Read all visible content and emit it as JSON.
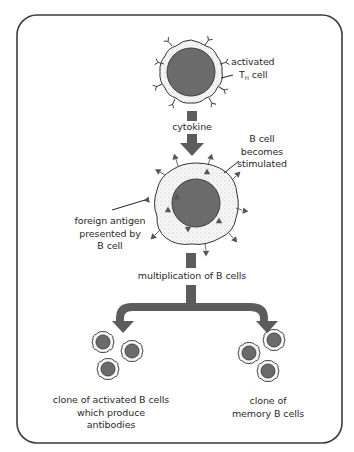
{
  "diagram": {
    "colors": {
      "border": "#3c3c3c",
      "nucleus": "#6b6b6b",
      "arrow": "#5c5c5c",
      "cytoplasm": "#f1f1f1",
      "text": "#2a2a2a"
    },
    "labels": {
      "th_cell": {
        "line1": "activated",
        "line2_main": "T",
        "line2_sub": "H",
        "line2_rest": " cell"
      },
      "cytokine": "cytokine",
      "b_cell_stimulated": [
        "B cell",
        "becomes",
        "stimulated"
      ],
      "foreign_antigen": [
        "foreign antigen",
        "presented by",
        "B cell"
      ],
      "multiplication": "multiplication of B cells",
      "clone_activated": [
        "clone of activated B cells",
        "which produce",
        "antibodies"
      ],
      "clone_memory": [
        "clone of",
        "memory B cells"
      ]
    },
    "nodes": [
      {
        "id": "activated-th-cell",
        "type": "cell"
      },
      {
        "id": "stimulated-b-cell",
        "type": "cell"
      },
      {
        "id": "activated-b-clone",
        "type": "cell-group",
        "count": 3
      },
      {
        "id": "memory-b-clone",
        "type": "cell-group",
        "count": 3
      }
    ],
    "edges": [
      {
        "from": "activated-th-cell",
        "to": "stimulated-b-cell",
        "label": "cytokine"
      },
      {
        "from": "stimulated-b-cell",
        "to": "activated-b-clone",
        "label": "multiplication of B cells"
      },
      {
        "from": "stimulated-b-cell",
        "to": "memory-b-clone",
        "label": "multiplication of B cells"
      }
    ]
  }
}
